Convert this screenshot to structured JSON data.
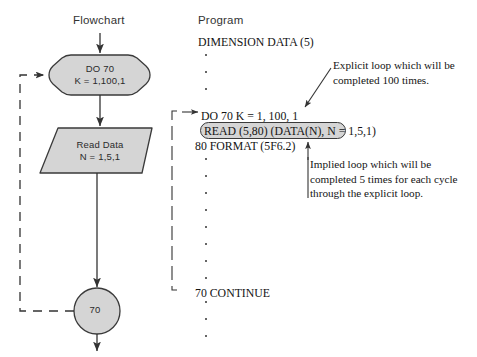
{
  "figure": {
    "kind": "flowchart-program-comparison",
    "ink_color": "#333333",
    "shape_fill": "#d5d5d5",
    "shape_stroke": "#3a3a3a",
    "background": "#ffffff"
  },
  "headings": {
    "flowchart": "Flowchart",
    "program": "Program"
  },
  "flowchart": {
    "nodes": [
      {
        "id": "do-loop",
        "shape": "hexagon",
        "line1": "DO 70",
        "line2": "K = 1,100,1"
      },
      {
        "id": "read-data",
        "shape": "parallelogram",
        "line1": "Read Data",
        "line2": "N = 1,5,1"
      },
      {
        "id": "connector-70",
        "shape": "circle",
        "label": "70"
      }
    ],
    "feedback_edge": {
      "style": "dashed",
      "from": "connector-70",
      "to": "do-loop"
    }
  },
  "program": {
    "lines": [
      {
        "id": "dimension",
        "text": "DIMENSION DATA (5)"
      },
      {
        "id": "do",
        "text": "DO 70 K = 1, 100, 1"
      },
      {
        "id": "read",
        "text": "READ (5,80) (DATA(N), N = 1,5,1)",
        "highlighted": true
      },
      {
        "id": "format",
        "text": "80 FORMAT (5F6.2)"
      },
      {
        "id": "continue",
        "text": "70 CONTINUE"
      }
    ],
    "ellipsis_groups": [
      {
        "after": "dimension",
        "count": 3
      },
      {
        "after": "format",
        "count": 8
      },
      {
        "after": "continue",
        "count": 3
      }
    ],
    "loop_bracket": {
      "style": "solid",
      "spans": "DO 70 K = 1, 100, 1 through 70 CONTINUE"
    }
  },
  "annotations": {
    "explicit": "Explicit loop which will be completed 100 times.",
    "implied": "Implied loop which will be completed 5 times for each cycle through the explicit loop."
  }
}
